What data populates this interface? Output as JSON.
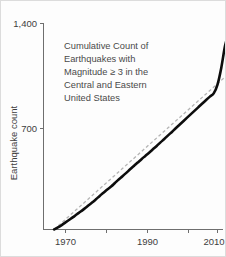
{
  "chart_data": {
    "type": "line",
    "title": "Cumulative Count of Earthquakes with Magnitude ≥ 3 in the Central and Eastern United States",
    "title_lines": [
      "Cumulative Count of",
      "Earthquakes with",
      "Magnitude ≥ 3 in the",
      "Central and Eastern",
      "United States"
    ],
    "xlabel": "",
    "ylabel": "Earthquake count",
    "xlim": [
      1967,
      2014
    ],
    "ylim": [
      0,
      1400
    ],
    "grid": false,
    "legend": "none",
    "xticks": [
      1970,
      1980,
      1990,
      2000,
      2010
    ],
    "xticklabels": [
      "1970",
      "",
      "1990",
      "",
      "2010"
    ],
    "yticks": [
      700,
      1400
    ],
    "yticklabels": [
      "700",
      "1,400"
    ],
    "series": [
      {
        "name": "Cumulative earthquake count",
        "style": "solid",
        "color": "#0d0d0d",
        "x": [
          1967,
          1968,
          1969,
          1970,
          1971,
          1972,
          1973,
          1974,
          1975,
          1976,
          1977,
          1978,
          1979,
          1980,
          1981,
          1982,
          1983,
          1984,
          1985,
          1986,
          1987,
          1988,
          1989,
          1990,
          1991,
          1992,
          1993,
          1994,
          1995,
          1996,
          1997,
          1998,
          1999,
          2000,
          2001,
          2002,
          2003,
          2004,
          2005,
          2006,
          2007,
          2008,
          2009,
          2010,
          2011,
          2012,
          2013
        ],
        "values": [
          0,
          14,
          30,
          48,
          66,
          84,
          104,
          122,
          142,
          163,
          183,
          205,
          228,
          250,
          272,
          292,
          316,
          340,
          362,
          385,
          409,
          432,
          455,
          478,
          500,
          522,
          545,
          568,
          592,
          615,
          640,
          663,
          688,
          712,
          736,
          760,
          784,
          808,
          832,
          856,
          880,
          903,
          925,
          985,
          1100,
          1250,
          1340
        ]
      },
      {
        "name": "Linear trend reference",
        "style": "dashed",
        "color": "#b4b4b4",
        "x": [
          1967,
          2013
        ],
        "values": [
          0,
          1060
        ]
      }
    ]
  }
}
